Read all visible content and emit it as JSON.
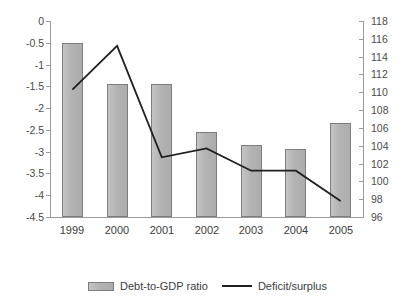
{
  "chart_data": {
    "type": "bar",
    "title": "",
    "subtitle": "",
    "xlabel": "",
    "ylabel": "",
    "categories": [
      "1999",
      "2000",
      "2001",
      "2002",
      "2003",
      "2004",
      "2005"
    ],
    "grid": false,
    "legend_position": "bottom",
    "axes": {
      "left": {
        "label": "",
        "ylim": [
          -4.5,
          0
        ],
        "tick_step": 0.5,
        "ticks": [
          "0",
          "-0.5",
          "-1",
          "-1.5",
          "-2",
          "-2.5",
          "-3",
          "-3.5",
          "-4",
          "-4.5"
        ],
        "tick_values": [
          0,
          -0.5,
          -1,
          -1.5,
          -2,
          -2.5,
          -3,
          -3.5,
          -4,
          -4.5
        ]
      },
      "right": {
        "label": "",
        "ylim": [
          96,
          118
        ],
        "tick_step": 2,
        "ticks": [
          "118",
          "116",
          "114",
          "112",
          "110",
          "108",
          "106",
          "104",
          "102",
          "100",
          "98",
          "96"
        ],
        "tick_values": [
          118,
          116,
          114,
          112,
          110,
          108,
          106,
          104,
          102,
          100,
          98,
          96
        ]
      }
    },
    "series": [
      {
        "name": "Debt-to-GDP ratio",
        "type": "bar",
        "axis": "left",
        "color": "#b7b7b7",
        "values": [
          -0.5,
          -1.45,
          -1.45,
          -2.55,
          -2.85,
          -2.95,
          -2.35
        ]
      },
      {
        "name": "Deficit/surplus",
        "type": "line",
        "axis": "right",
        "color": "#1f1f1f",
        "values": [
          110.3,
          115.2,
          102.7,
          103.7,
          101.2,
          101.2,
          97.8
        ]
      }
    ]
  },
  "legend": {
    "items": [
      {
        "label": "Debt-to-GDP ratio",
        "marker": "bar-swatch"
      },
      {
        "label": "Deficit/surplus",
        "marker": "line-swatch"
      }
    ]
  }
}
